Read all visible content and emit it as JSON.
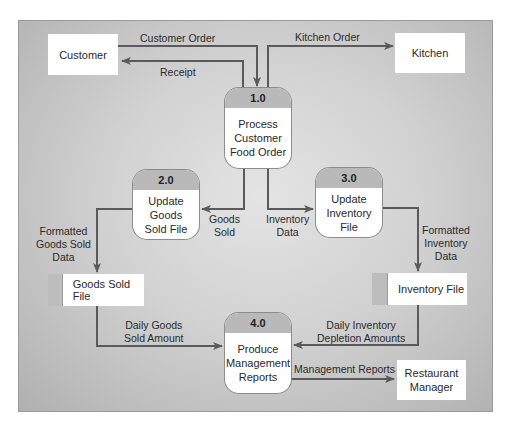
{
  "diagram": {
    "type": "data-flow-diagram",
    "colors": {
      "panel_center": "#e4e4e4",
      "panel_edge": "#b0b0b0",
      "process_header": "#b9b9b9",
      "arrow": "#5a5a5a",
      "box": "#ffffff"
    },
    "external_entities": [
      {
        "id": "customer",
        "label": "Customer"
      },
      {
        "id": "kitchen",
        "label": "Kitchen"
      },
      {
        "id": "manager",
        "label": "Restaurant Manager",
        "line1": "Restaurant",
        "line2": "Manager"
      }
    ],
    "processes": [
      {
        "id": "1.0",
        "label": "Process Customer Food Order",
        "lines": [
          "Process",
          "Customer",
          "Food Order"
        ]
      },
      {
        "id": "2.0",
        "label": "Update Goods Sold File",
        "lines": [
          "Update",
          "Goods",
          "Sold File"
        ]
      },
      {
        "id": "3.0",
        "label": "Update Inventory File",
        "lines": [
          "Update",
          "Inventory",
          "File"
        ]
      },
      {
        "id": "4.0",
        "label": "Produce Management Reports",
        "lines": [
          "Produce",
          "Management",
          "Reports"
        ]
      }
    ],
    "data_stores": [
      {
        "id": "goods_sold_file",
        "label": "Goods Sold File"
      },
      {
        "id": "inventory_file",
        "label": "Inventory File"
      }
    ],
    "flows": [
      {
        "from": "Customer",
        "to": "1.0",
        "label": "Customer Order",
        "lines": [
          "Customer Order"
        ]
      },
      {
        "from": "1.0",
        "to": "Customer",
        "label": "Receipt",
        "lines": [
          "Receipt"
        ]
      },
      {
        "from": "1.0",
        "to": "Kitchen",
        "label": "Kitchen Order",
        "lines": [
          "Kitchen Order"
        ]
      },
      {
        "from": "1.0",
        "to": "2.0",
        "label": "Goods Sold",
        "lines": [
          "Goods",
          "Sold"
        ]
      },
      {
        "from": "1.0",
        "to": "3.0",
        "label": "Inventory Data",
        "lines": [
          "Inventory",
          "Data"
        ]
      },
      {
        "from": "2.0",
        "to": "Goods Sold File",
        "label": "Formatted Goods Sold Data",
        "lines": [
          "Formatted",
          "Goods Sold",
          "Data"
        ]
      },
      {
        "from": "3.0",
        "to": "Inventory File",
        "label": "Formatted Inventory Data",
        "lines": [
          "Formatted",
          "Inventory",
          "Data"
        ]
      },
      {
        "from": "Goods Sold File",
        "to": "4.0",
        "label": "Daily Goods Sold Amount",
        "lines": [
          "Daily Goods",
          "Sold Amount"
        ]
      },
      {
        "from": "Inventory File",
        "to": "4.0",
        "label": "Daily Inventory Depletion Amounts",
        "lines": [
          "Daily Inventory",
          "Depletion Amounts"
        ]
      },
      {
        "from": "4.0",
        "to": "Restaurant Manager",
        "label": "Management Reports",
        "lines": [
          "Management Reports"
        ]
      }
    ]
  }
}
